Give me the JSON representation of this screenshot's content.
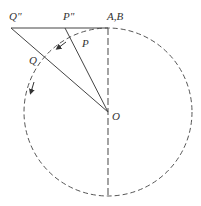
{
  "diagram": {
    "type": "geometry",
    "labels": {
      "q_double_prime": "Q\"",
      "p_double_prime": "P\"",
      "ab": "A,B",
      "p": "P",
      "q": "Q",
      "o": "O"
    },
    "colors": {
      "stroke": "#444444",
      "background": "#ffffff"
    }
  }
}
